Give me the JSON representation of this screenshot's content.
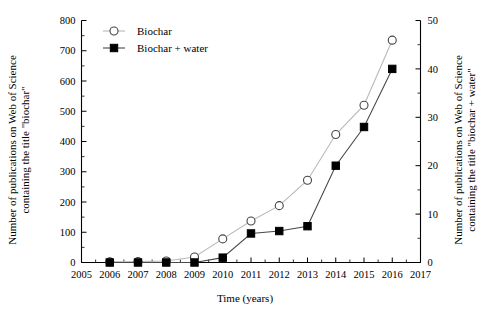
{
  "chart_data": {
    "type": "line",
    "title": "",
    "xlabel": "Time (years)",
    "ylabel": "Number of publications on Web of Science containing the title \"biochar\"",
    "y2label": "Number of publications on Web of Science containing the title \"biochar + water\"",
    "x": [
      2005,
      2006,
      2007,
      2008,
      2009,
      2010,
      2011,
      2012,
      2013,
      2014,
      2015,
      2016,
      2017
    ],
    "xlim": [
      2005,
      2017
    ],
    "ylim": [
      0,
      800
    ],
    "y2lim": [
      0,
      50
    ],
    "xticks": [
      "2005",
      "2006",
      "2007",
      "2008",
      "2009",
      "2010",
      "2011",
      "2012",
      "2013",
      "2014",
      "2015",
      "2016",
      "2017"
    ],
    "yticks": [
      "0",
      "100",
      "200",
      "300",
      "400",
      "500",
      "600",
      "700",
      "800"
    ],
    "y2ticks": [
      "0",
      "10",
      "20",
      "30",
      "40",
      "50"
    ],
    "grid": false,
    "legend_position": "top-left",
    "series": [
      {
        "name": "Biochar",
        "axis": "left",
        "marker": "open-circle",
        "color": "#b9b9b9",
        "x": [
          2006,
          2007,
          2008,
          2009,
          2010,
          2011,
          2012,
          2013,
          2014,
          2015,
          2016
        ],
        "values": [
          2,
          3,
          5,
          18,
          78,
          137,
          188,
          272,
          423,
          520,
          735
        ]
      },
      {
        "name": "Biochar + water",
        "axis": "right",
        "marker": "filled-square",
        "color": "#3a3a3a",
        "x": [
          2006,
          2007,
          2008,
          2009,
          2010,
          2011,
          2012,
          2013,
          2014,
          2015,
          2016
        ],
        "values": [
          0,
          0,
          0,
          0,
          1,
          6,
          6.5,
          7.5,
          20,
          28,
          40
        ]
      }
    ]
  },
  "legend": {
    "items": [
      {
        "label": "Biochar"
      },
      {
        "label": "Biochar + water"
      }
    ]
  }
}
